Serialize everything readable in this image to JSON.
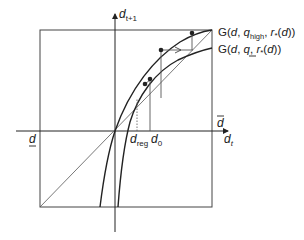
{
  "diagram": {
    "axes": {
      "x_label": "d",
      "x_label_sub": "t",
      "y_label": "d",
      "y_label_sub": "t+1"
    },
    "ticks": {
      "d_low": "d",
      "d_high": "d",
      "d_reg": "d",
      "d_reg_sub": "reg",
      "d0": "d",
      "d0_sub": "0"
    },
    "curves": {
      "high": {
        "prefix": "G(",
        "d": "d",
        "sep1": ", ",
        "q": "q",
        "q_sub": "high",
        "sep2": ", ",
        "r": "r",
        "r_sub": "*",
        "paren_open": "(",
        "d2": "d",
        "suffix": "))"
      },
      "low": {
        "prefix": "G(",
        "d": "d",
        "sep1": ", ",
        "q": "q",
        "sep2": ", ",
        "r": "r",
        "r_sub": "*",
        "paren_open": "(",
        "d2": "d",
        "suffix": "))"
      }
    },
    "elements": [
      "45-degree line",
      "upper curve G(d, q_high, r*(d))",
      "lower curve G(d, q_low, r*(d))",
      "staircase iteration starting at d0 with arrow",
      "dotted line at d_reg",
      "bounding box from d_low to d_high"
    ],
    "colors": {
      "line": "#222222",
      "thin_line": "#555555",
      "background": "#ffffff"
    }
  }
}
